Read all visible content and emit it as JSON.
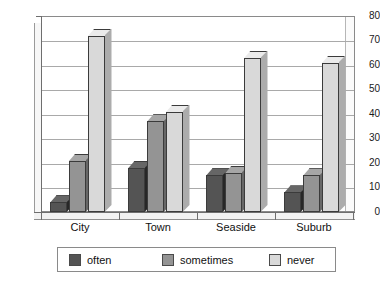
{
  "chart_data": {
    "type": "bar",
    "title": "",
    "subtitle": "",
    "xlabel": "",
    "ylabel": "",
    "categories": [
      "City",
      "Town",
      "Seaside",
      "Suburb"
    ],
    "series": [
      {
        "name": "often",
        "color": "#545454",
        "values": [
          4,
          18,
          15,
          8
        ]
      },
      {
        "name": "sometimes",
        "color": "#949494",
        "values": [
          21,
          37,
          16,
          15
        ]
      },
      {
        "name": "never",
        "color": "#d9d9d9",
        "values": [
          72,
          41,
          63,
          61
        ]
      }
    ],
    "ylim": [
      0,
      80
    ],
    "ytick_labels": [
      "0",
      "10",
      "20",
      "30",
      "40",
      "50",
      "60",
      "70",
      "80"
    ],
    "ytick_values": [
      0,
      10,
      20,
      30,
      40,
      50,
      60,
      70,
      80
    ],
    "grid": true,
    "grid_axis": "y",
    "legend_position": "bottom",
    "style": "3d-column",
    "colors": {
      "plot_background": "#ffffff",
      "grid_line": "#a9a9a9",
      "axis_line": "#6e6e6e",
      "border": "#8a8a8a",
      "text": "#111111"
    }
  },
  "legend": {
    "entries": [
      {
        "label": "often"
      },
      {
        "label": "sometimes"
      },
      {
        "label": "never"
      }
    ]
  }
}
